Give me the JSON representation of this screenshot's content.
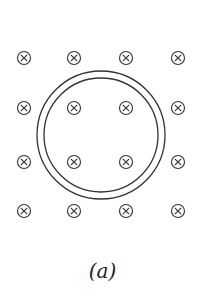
{
  "figure": {
    "label": "(a)",
    "field_symbol": "into-page-cross",
    "grid": {
      "columns_x": [
        24,
        74,
        126,
        178
      ],
      "rows_y": [
        58,
        108,
        162,
        211
      ]
    },
    "loop": {
      "cx": 101,
      "cy": 135,
      "outer_r": 64,
      "inner_r": 57
    },
    "stroke_color": "#333333"
  }
}
